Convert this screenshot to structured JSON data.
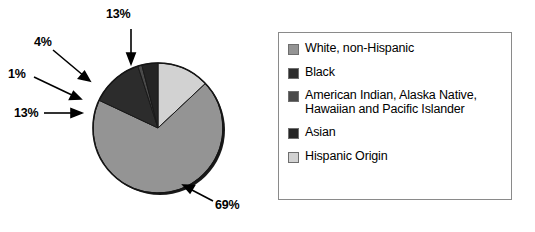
{
  "chart_data": {
    "type": "pie",
    "title": "",
    "subtitle": "",
    "xlabel": "",
    "ylabel": "",
    "grid": false,
    "legend_position": "right",
    "units": "percent",
    "start_angle_deg": 0,
    "direction": "clockwise",
    "categories": [
      "Hispanic Origin",
      "Asian",
      "American Indian, Alaska Native, Hawaiian and Pacific Islander",
      "Black",
      "White, non-Hispanic"
    ],
    "values": [
      13,
      4,
      1,
      13,
      69
    ],
    "data_labels": [
      "13%",
      "4%",
      "1%",
      "13%",
      "69%"
    ],
    "colors": [
      "#d2d2d2",
      "#242424",
      "#4a4a4a",
      "#2c2c2c",
      "#949494"
    ]
  },
  "pie": {
    "slices": [
      {
        "name": "Hispanic Origin",
        "value": 13,
        "label": "13%",
        "color": "#d2d2d2"
      },
      {
        "name": "Asian",
        "value": 4,
        "label": "4%",
        "color": "#242424"
      },
      {
        "name": "American Indian, Alaska Native, Hawaiian and Pacific Islander",
        "value": 1,
        "label": "1%",
        "color": "#4a4a4a"
      },
      {
        "name": "Black",
        "value": 13,
        "label": "13%",
        "color": "#2c2c2c"
      },
      {
        "name": "White, non-Hispanic",
        "value": 69,
        "label": "69%",
        "color": "#949494"
      }
    ],
    "callouts": {
      "hispanic": "13%",
      "asian": "4%",
      "american_indian": "1%",
      "black": "13%",
      "white": "69%"
    }
  },
  "legend": {
    "items": [
      {
        "label": "White, non-Hispanic",
        "label_line2": "",
        "color": "#949494"
      },
      {
        "label": "Black",
        "label_line2": "",
        "color": "#2c2c2c"
      },
      {
        "label": "American Indian, Alaska Native,",
        "label_line2": "Hawaiian and Pacific Islander",
        "color": "#4a4a4a"
      },
      {
        "label": "Asian",
        "label_line2": "",
        "color": "#242424"
      },
      {
        "label": "Hispanic Origin",
        "label_line2": "",
        "color": "#d2d2d2"
      }
    ]
  }
}
